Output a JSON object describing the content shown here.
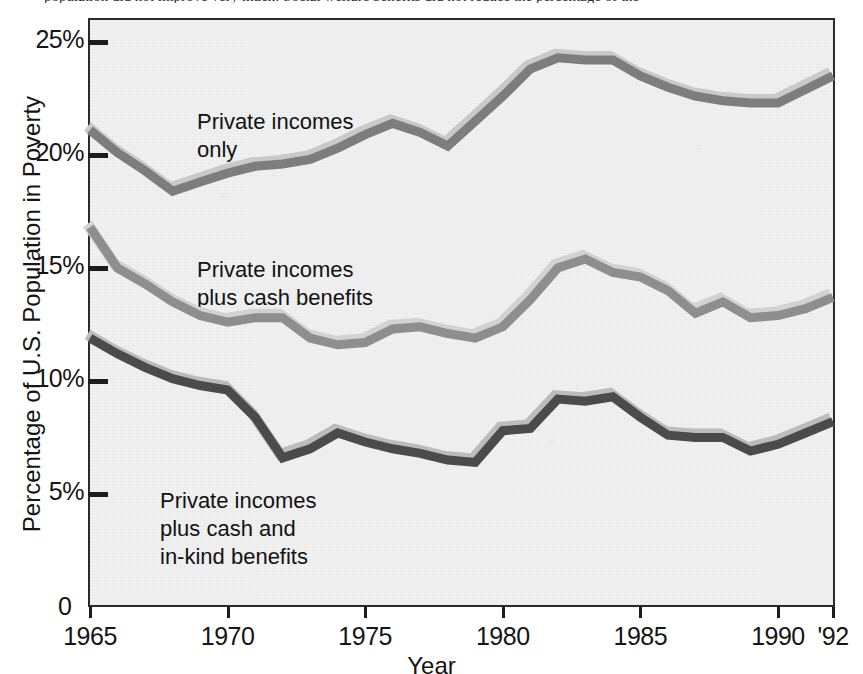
{
  "caption": {
    "text": "population did not improve very much: Social welfare benefits did not reduce the percentage of the"
  },
  "chart_data": {
    "type": "line",
    "title": "",
    "xlabel": "Year",
    "ylabel": "Percentage of U.S. Population in Poverty",
    "xlim": [
      1965,
      1992
    ],
    "ylim": [
      0,
      26.5
    ],
    "grid": false,
    "legend_position": "inline-annotations",
    "x_tick_labels": [
      "1965",
      "1970",
      "1975",
      "1980",
      "1985",
      "1990",
      "'92"
    ],
    "x_tick_values": [
      1965,
      1970,
      1975,
      1980,
      1985,
      1990,
      1992
    ],
    "y_tick_labels": [
      "0",
      "5%",
      "10%",
      "15%",
      "20%",
      "25%"
    ],
    "y_tick_values": [
      0,
      5,
      10,
      15,
      20,
      25
    ],
    "x": [
      1965,
      1966,
      1967,
      1968,
      1969,
      1970,
      1971,
      1972,
      1973,
      1974,
      1975,
      1976,
      1977,
      1978,
      1979,
      1980,
      1981,
      1982,
      1983,
      1984,
      1985,
      1986,
      1987,
      1988,
      1989,
      1990,
      1991,
      1992
    ],
    "series": [
      {
        "name": "Private incomes only",
        "label": "Private incomes\nonly",
        "color": "#7d7d7d",
        "highlight_color": "#c9c9c9",
        "values": [
          21.1,
          20.1,
          19.3,
          18.4,
          18.8,
          19.2,
          19.5,
          19.6,
          19.8,
          20.3,
          20.9,
          21.4,
          21.0,
          20.4,
          21.5,
          22.6,
          23.8,
          24.3,
          24.2,
          24.2,
          23.5,
          23.0,
          22.6,
          22.4,
          22.3,
          22.3,
          22.9,
          23.5
        ]
      },
      {
        "name": "Private incomes plus cash benefits",
        "label": "Private incomes\nplus cash benefits",
        "color": "#8e8e8e",
        "highlight_color": "#d2d2d2",
        "values": [
          16.8,
          15.0,
          14.3,
          13.5,
          12.9,
          12.6,
          12.8,
          12.8,
          11.9,
          11.6,
          11.7,
          12.3,
          12.4,
          12.1,
          11.9,
          12.4,
          13.6,
          15.0,
          15.4,
          14.8,
          14.6,
          14.0,
          13.0,
          13.5,
          12.8,
          12.9,
          13.2,
          13.7
        ]
      },
      {
        "name": "Private incomes plus cash and in-kind benefits",
        "label": "Private incomes\nplus cash and\nin-kind benefits",
        "color": "#4b4b4b",
        "highlight_color": "#bcbcbc",
        "values": [
          11.9,
          11.2,
          10.6,
          10.1,
          9.8,
          9.6,
          8.4,
          6.6,
          7.0,
          7.7,
          7.3,
          7.0,
          6.8,
          6.5,
          6.4,
          7.8,
          7.9,
          9.2,
          9.1,
          9.3,
          8.4,
          7.6,
          7.5,
          7.5,
          6.9,
          7.2,
          7.7,
          8.2
        ]
      }
    ]
  }
}
